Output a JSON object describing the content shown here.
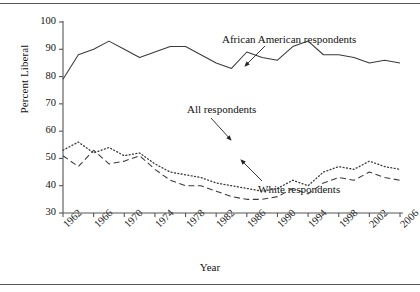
{
  "figure": {
    "ylabel": "Percent Liberal",
    "xlabel": "Year",
    "rule_top": "horizontal-rule",
    "rule_bottom": "horizontal-rule"
  },
  "annotations": [
    {
      "id": "ann-african-american",
      "text": "African American respondents",
      "x": 222,
      "y": 33,
      "arrow": {
        "x1": 265,
        "y1": 46,
        "x2": 245,
        "y2": 66
      }
    },
    {
      "id": "ann-all",
      "text": "All respondents",
      "x": 187,
      "y": 103,
      "arrow": {
        "x1": 211,
        "y1": 118,
        "x2": 231,
        "y2": 140
      }
    },
    {
      "id": "ann-white",
      "text": "White respondents",
      "x": 258,
      "y": 183,
      "arrow": {
        "x1": 262,
        "y1": 181,
        "x2": 241,
        "y2": 160
      }
    }
  ],
  "chart_data": {
    "type": "line",
    "title": "",
    "xlabel": "Year",
    "ylabel": "Percent Liberal",
    "xlim": [
      1962,
      2006
    ],
    "ylim": [
      30,
      100
    ],
    "yticks": [
      30,
      40,
      50,
      60,
      70,
      80,
      90,
      100
    ],
    "xticks": [
      1962,
      1966,
      1970,
      1974,
      1978,
      1982,
      1986,
      1990,
      1994,
      1998,
      2002,
      2006
    ],
    "grid": false,
    "legend": "inline-annotations",
    "x": [
      1962,
      1964,
      1966,
      1968,
      1970,
      1972,
      1974,
      1976,
      1978,
      1980,
      1982,
      1984,
      1986,
      1988,
      1990,
      1992,
      1994,
      1996,
      1998,
      2000,
      2002,
      2004,
      2006
    ],
    "series": [
      {
        "name": "African American respondents",
        "style": "solid",
        "values": [
          79,
          88,
          90,
          93,
          90,
          87,
          89,
          91,
          91,
          88,
          85,
          83,
          89,
          87,
          86,
          91,
          93,
          88,
          88,
          87,
          85,
          86,
          85
        ]
      },
      {
        "name": "All respondents",
        "style": "dotted",
        "values": [
          53,
          56,
          52,
          54,
          51,
          52,
          48,
          45,
          44,
          43,
          41,
          40,
          39,
          38,
          39,
          42,
          40,
          45,
          47,
          46,
          49,
          47,
          46
        ]
      },
      {
        "name": "White respondents",
        "style": "dashed",
        "values": [
          51,
          47,
          53,
          48,
          49,
          51,
          46,
          42,
          40,
          40,
          38,
          36,
          35,
          35,
          36,
          39,
          37,
          41,
          43,
          42,
          45,
          43,
          42
        ]
      }
    ]
  }
}
